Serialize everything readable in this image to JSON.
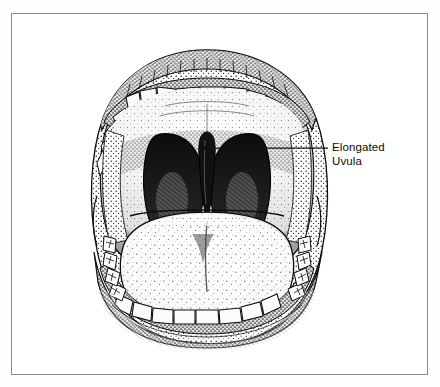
{
  "figure": {
    "kind": "medical-line-illustration",
    "view": "frontal",
    "style": "pen-and-ink stipple engraving",
    "frame": {
      "visible": true,
      "border_color": "#8a8a8a",
      "background_color": "#ffffff",
      "x": 11,
      "y": 13,
      "width": 417,
      "height": 362
    },
    "canvas": {
      "width": 440,
      "height": 387,
      "background_color": "#fefefe"
    },
    "ink_color": "#101010"
  },
  "annotations": [
    {
      "id": "uvula-callout",
      "label_lines": [
        "Elongated",
        "Uvula"
      ],
      "line1": "Elongated",
      "line2": "Uvula",
      "text_color": "#0b0b0b",
      "leader": {
        "point_x": 205,
        "point_y": 148,
        "end_x": 328,
        "end_y": 148,
        "has_dot": true
      }
    }
  ],
  "anatomy": {
    "parts": [
      {
        "name": "upper-lip",
        "shading": "stipple-dense"
      },
      {
        "name": "upper-teeth-arch",
        "count": 14
      },
      {
        "name": "hard-palate",
        "shading": "stipple-light"
      },
      {
        "name": "soft-palate",
        "shading": "stipple-medium"
      },
      {
        "name": "anterior-tonsillar-pillar-left",
        "tone": "dark"
      },
      {
        "name": "anterior-tonsillar-pillar-right",
        "tone": "dark"
      },
      {
        "name": "uvula",
        "state": "elongated",
        "tone": "dark"
      },
      {
        "name": "tongue",
        "shading": "stipple-speckle"
      },
      {
        "name": "lower-teeth-arch",
        "count": 12
      },
      {
        "name": "lower-lip",
        "shading": "stipple-dense"
      },
      {
        "name": "oral-commissure-left"
      },
      {
        "name": "oral-commissure-right"
      }
    ]
  }
}
